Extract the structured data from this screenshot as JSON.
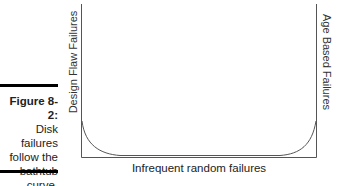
{
  "caption": {
    "figure_label": "Figure 8-2:",
    "text": "Disk failures follow the bathtub curve."
  },
  "diagram": {
    "type": "bathtub-curve",
    "left_axis_label": "Design Flaw Failures",
    "right_axis_label": "Age Based Failures",
    "bottom_label": "Infrequent random failures",
    "line_color": "#555555"
  }
}
